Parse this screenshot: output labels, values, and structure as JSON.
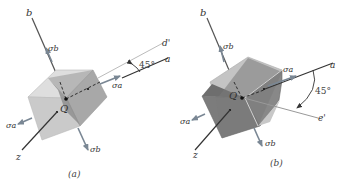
{
  "panels": [
    {
      "id": "a",
      "caption": "(a)",
      "axis_labels": {
        "a": "a",
        "b": "b",
        "z": "z",
        "rotated": "d'"
      },
      "angle_label": "45°",
      "stress_labels": {
        "sa": "σa",
        "sb": "σb"
      },
      "origin_label": "Q",
      "colors": {
        "top": "#dcdcdc",
        "front": "#c8c8c8",
        "side": "#a9a9a9",
        "inner": "#8f8f8f",
        "axis": "#333333",
        "arrow": "#7a8794",
        "rotated_line": "#b8b8b8"
      }
    },
    {
      "id": "b",
      "caption": "(b)",
      "axis_labels": {
        "a": "a",
        "b": "b",
        "z": "z",
        "rotated": "e'"
      },
      "angle_label": "45°",
      "stress_labels": {
        "sa": "σa",
        "sb": "σb"
      },
      "origin_label": "Q",
      "colors": {
        "top": "#c6c6c6",
        "front": "#7d7d7d",
        "side": "#8a8a8a",
        "axis": "#333333",
        "arrow": "#7a8794",
        "rotated_line": "#9a9a9a"
      }
    }
  ]
}
